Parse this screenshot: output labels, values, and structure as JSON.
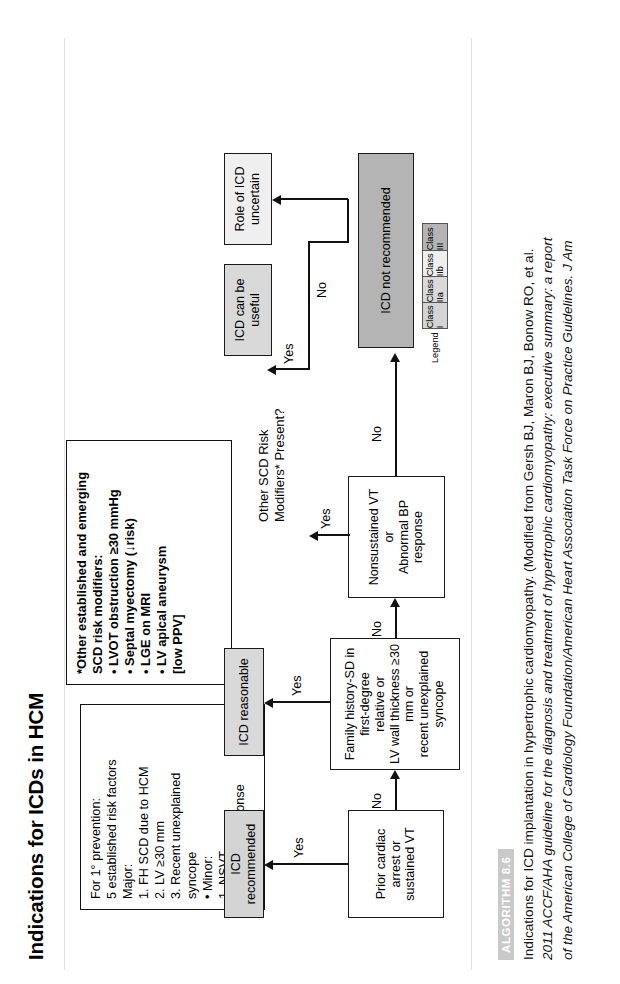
{
  "title": "Indications for ICDs in HCM",
  "algorithm_badge": "ALGORITHM 8.6",
  "caption": {
    "line1": "Indications for ICD implantation in hypertrophic cardiomyopathy. (Modified from Gersh BJ, Maron BJ, Bonow RO, et al.",
    "line2": "2011 ACCF/AHA guideline for the diagnosis and treatment of hypertrophic cardiomyopathy: executive summary: a report",
    "line3": "of the American College of Cardiology Foundation/American Heart Association Task Force on Practice Guidelines. J Am"
  },
  "nodes": {
    "prior_arrest": "Prior cardiac arrest or\nsustained VT",
    "family_history": "Family history-SD in first-degree\nrelative or\nLV wall thickness ≥30 mm or\nrecent unexplained syncope",
    "nonsustained_vt": "Nonsustained VT\nor\nAbnormal BP response",
    "icd_recommended": "ICD recommended",
    "icd_reasonable": "ICD reasonable",
    "icd_can_be_useful": "ICD can be\nuseful",
    "role_uncertain": "Role of ICD\nuncertain",
    "icd_not_recommended": "ICD not recommended"
  },
  "branch_question": "Other SCD Risk\nModifiers* Present?",
  "edge_labels": {
    "yes1": "Yes",
    "no1": "No",
    "yes2": "Yes",
    "no2": "No",
    "yes3": "Yes",
    "no3": "No",
    "yes4": "Yes",
    "no4": "No"
  },
  "risk_factors_box": {
    "text": "For 1° prevention:\n5 established risk factors\nMajor:\n  1. FH SCD due to HCM\n  2. LV ≥30 mm\n  3. Recent unexplained\n        syncope\n  • Minor:\n  1. NSVT\n  2. Abnl BP response"
  },
  "modifiers_box": {
    "text": "*Other established and emerging\nSCD risk modifiers:\n• LVOT obstruction ≥30 mmHg\n• Septal myectomy (↓risk)\n• LGE on MRI\n• LV apical aneurysm\n   [low PPV]"
  },
  "legend": {
    "title": "Legend",
    "items": [
      {
        "label": "Class I",
        "color": "#d4d4d4"
      },
      {
        "label": "Class IIa",
        "color": "#d9d9d9"
      },
      {
        "label": "Class IIb",
        "color": "#efefef"
      },
      {
        "label": "Class III",
        "color": "#b4b4b4"
      }
    ]
  }
}
